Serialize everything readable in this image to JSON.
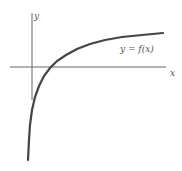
{
  "chart_data": {
    "type": "line",
    "title": "",
    "xlabel": "x",
    "ylabel": "y",
    "series": [
      {
        "name": "y = f(x)",
        "description": "increasing concave-down curve with vertical asymptote near the y-axis (logarithmic shape), crossing the x-axis to the right of the origin",
        "points_px": [
          [
            28,
            160
          ],
          [
            29,
            140
          ],
          [
            30,
            125
          ],
          [
            32,
            110
          ],
          [
            35,
            97
          ],
          [
            39,
            86
          ],
          [
            44,
            76
          ],
          [
            50,
            68
          ],
          [
            57,
            61
          ],
          [
            66,
            55
          ],
          [
            77,
            49
          ],
          [
            90,
            44
          ],
          [
            105,
            40
          ],
          [
            122,
            37
          ],
          [
            142,
            35
          ],
          [
            163,
            33
          ]
        ]
      }
    ],
    "annotations": [
      {
        "text": "y = f(x)",
        "x": 120,
        "y": 52
      }
    ],
    "axes": {
      "x_axis": {
        "y": 67,
        "from": 10,
        "to": 166,
        "label": "x"
      },
      "y_axis": {
        "x": 32,
        "from": 13,
        "to": 100,
        "label": "y"
      }
    },
    "grid": false,
    "legend": "none"
  },
  "labels": {
    "x_axis": "x",
    "y_axis": "y",
    "curve": "y = f(x)"
  }
}
